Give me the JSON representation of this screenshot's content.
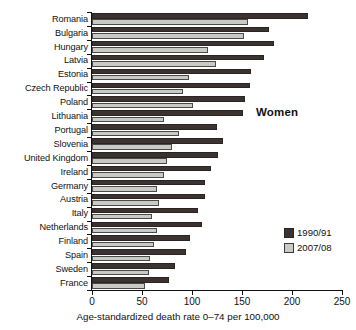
{
  "chart_data": {
    "type": "bar",
    "orientation": "horizontal",
    "title": "Women",
    "xlabel": "Age-standardized death rate 0–74 per 100,000",
    "ylabel": "",
    "xlim": [
      0,
      250
    ],
    "xticks": [
      0,
      50,
      100,
      150,
      200,
      250
    ],
    "xtick_labels": [
      "0",
      "50",
      "100",
      "150",
      "200",
      "250"
    ],
    "grid": false,
    "legend_position": "right-lower",
    "categories": [
      "Romania",
      "Bulgaria",
      "Hungary",
      "Latvia",
      "Estonia",
      "Czech Republic",
      "Poland",
      "Lithuania",
      "Portugal",
      "Slovenia",
      "United Kingdom",
      "Ireland",
      "Germany",
      "Austria",
      "Italy",
      "Netherlands",
      "Finland",
      "Spain",
      "Sweden",
      "France"
    ],
    "series": [
      {
        "name": "1990/91",
        "color": "#3a3330",
        "values": [
          216,
          177,
          182,
          172,
          159,
          158,
          153,
          151,
          125,
          131,
          126,
          119,
          113,
          113,
          106,
          110,
          98,
          94,
          83,
          77
        ]
      },
      {
        "name": "2007/08",
        "color": "#c9c9c5",
        "values": [
          156,
          152,
          116,
          124,
          97,
          91,
          101,
          72,
          87,
          80,
          75,
          72,
          65,
          67,
          60,
          65,
          62,
          58,
          57,
          53
        ]
      }
    ]
  },
  "panel": {
    "title": "Women"
  },
  "legend": {
    "items": [
      {
        "label": "1990/91",
        "swatch": "dark"
      },
      {
        "label": "2007/08",
        "swatch": "light"
      }
    ]
  },
  "axis": {
    "x_title": "Age-standardized death rate 0–74 per 100,000"
  }
}
